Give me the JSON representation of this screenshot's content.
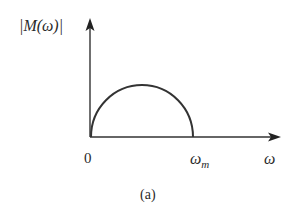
{
  "diagram": {
    "y_axis_label": "|M(ω)|",
    "x_axis_label": "ω",
    "origin_label": "0",
    "cutoff_label_base": "ω",
    "cutoff_label_sub": "m",
    "caption": "(a)",
    "curve": "semicircle from 0 to ω_m",
    "colors": {
      "stroke": "#333333",
      "background": "#ffffff"
    }
  }
}
